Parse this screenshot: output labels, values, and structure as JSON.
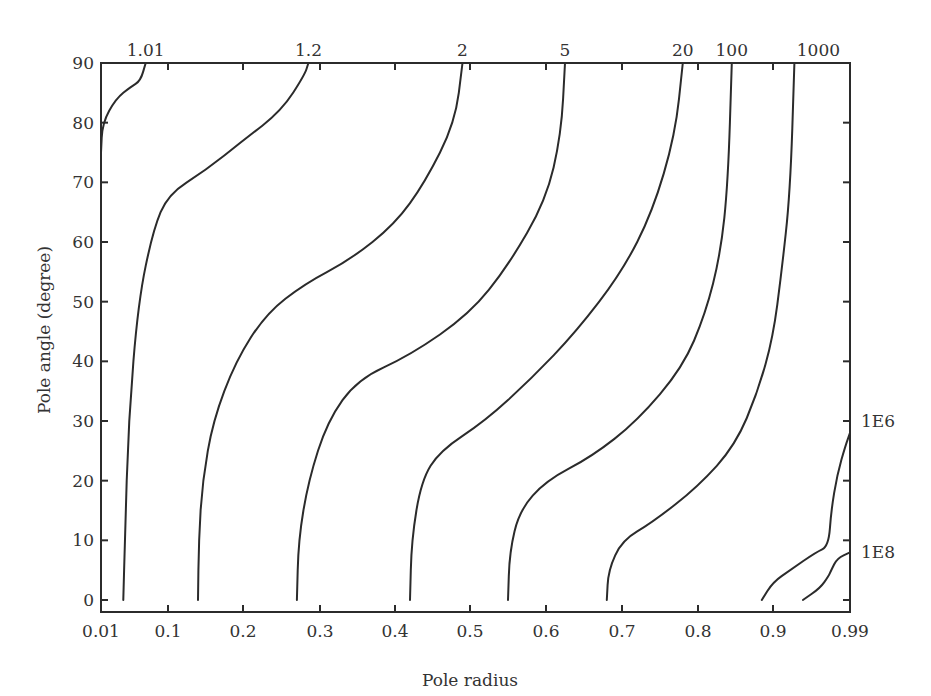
{
  "chart_data": {
    "type": "line",
    "subtype": "contour",
    "title": "",
    "xlabel": "Pole radius",
    "ylabel": "Pole angle (degree)",
    "x_tick_labels": [
      "0.01",
      "0.1",
      "0.2",
      "0.3",
      "0.4",
      "0.5",
      "0.6",
      "0.7",
      "0.8",
      "0.9",
      "0.99"
    ],
    "x_ticks": [
      0.01,
      0.1,
      0.2,
      0.3,
      0.4,
      0.5,
      0.6,
      0.7,
      0.8,
      0.9,
      0.99
    ],
    "y_tick_labels": [
      "0",
      "10",
      "20",
      "30",
      "40",
      "50",
      "60",
      "70",
      "80",
      "90"
    ],
    "y_ticks": [
      0,
      10,
      20,
      30,
      40,
      50,
      60,
      70,
      80,
      90
    ],
    "xlim": [
      0.01,
      0.99
    ],
    "ylim": [
      0,
      90
    ],
    "grid": false,
    "legend": "none (contour levels labeled inline)",
    "contour_levels": [
      {
        "label": "1.01",
        "label_pos": "top",
        "points": [
          [
            0.01,
            75
          ],
          [
            0.012,
            80
          ],
          [
            0.03,
            84
          ],
          [
            0.05,
            86
          ],
          [
            0.063,
            87
          ],
          [
            0.07,
            90
          ]
        ]
      },
      {
        "label": "1.2",
        "label_pos": "top",
        "points": [
          [
            0.04,
            0
          ],
          [
            0.042,
            10
          ],
          [
            0.047,
            30
          ],
          [
            0.06,
            50
          ],
          [
            0.08,
            62
          ],
          [
            0.1,
            68
          ],
          [
            0.15,
            72
          ],
          [
            0.2,
            77
          ],
          [
            0.25,
            82
          ],
          [
            0.28,
            88
          ],
          [
            0.285,
            90
          ]
        ]
      },
      {
        "label": "2",
        "label_pos": "top",
        "points": [
          [
            0.14,
            0
          ],
          [
            0.141,
            10
          ],
          [
            0.146,
            20
          ],
          [
            0.16,
            30
          ],
          [
            0.19,
            40
          ],
          [
            0.23,
            48
          ],
          [
            0.28,
            53
          ],
          [
            0.34,
            57
          ],
          [
            0.4,
            63
          ],
          [
            0.44,
            70
          ],
          [
            0.48,
            80
          ],
          [
            0.49,
            90
          ]
        ]
      },
      {
        "label": "5",
        "label_pos": "top",
        "points": [
          [
            0.27,
            0
          ],
          [
            0.272,
            10
          ],
          [
            0.285,
            20
          ],
          [
            0.31,
            30
          ],
          [
            0.35,
            37
          ],
          [
            0.42,
            41
          ],
          [
            0.5,
            48
          ],
          [
            0.55,
            56
          ],
          [
            0.6,
            67
          ],
          [
            0.62,
            78
          ],
          [
            0.625,
            90
          ]
        ]
      },
      {
        "label": "20",
        "label_pos": "top",
        "points": [
          [
            0.42,
            0
          ],
          [
            0.422,
            10
          ],
          [
            0.435,
            20
          ],
          [
            0.46,
            25
          ],
          [
            0.52,
            30
          ],
          [
            0.58,
            37
          ],
          [
            0.64,
            45
          ],
          [
            0.7,
            55
          ],
          [
            0.74,
            65
          ],
          [
            0.77,
            78
          ],
          [
            0.78,
            90
          ]
        ]
      },
      {
        "label": "100",
        "label_pos": "top",
        "points": [
          [
            0.55,
            0
          ],
          [
            0.552,
            8
          ],
          [
            0.565,
            15
          ],
          [
            0.6,
            20
          ],
          [
            0.66,
            24
          ],
          [
            0.72,
            30
          ],
          [
            0.78,
            39
          ],
          [
            0.81,
            48
          ],
          [
            0.83,
            58
          ],
          [
            0.84,
            70
          ],
          [
            0.845,
            90
          ]
        ]
      },
      {
        "label": "1000",
        "label_pos": "top",
        "points": [
          [
            0.68,
            0
          ],
          [
            0.682,
            5
          ],
          [
            0.7,
            10
          ],
          [
            0.74,
            13
          ],
          [
            0.8,
            19
          ],
          [
            0.85,
            26
          ],
          [
            0.88,
            35
          ],
          [
            0.9,
            44
          ],
          [
            0.91,
            55
          ],
          [
            0.92,
            68
          ],
          [
            0.925,
            90
          ]
        ]
      },
      {
        "label": "1E6",
        "label_pos": "right",
        "points": [
          [
            0.885,
            0
          ],
          [
            0.9,
            3
          ],
          [
            0.92,
            5
          ],
          [
            0.95,
            8
          ],
          [
            0.965,
            9
          ],
          [
            0.968,
            15
          ],
          [
            0.975,
            21
          ],
          [
            0.985,
            26
          ],
          [
            0.99,
            28
          ]
        ]
      },
      {
        "label": "1E8",
        "label_pos": "right",
        "points": [
          [
            0.935,
            0
          ],
          [
            0.955,
            2
          ],
          [
            0.965,
            4
          ],
          [
            0.968,
            5
          ],
          [
            0.975,
            7
          ],
          [
            0.99,
            8
          ]
        ]
      }
    ]
  }
}
